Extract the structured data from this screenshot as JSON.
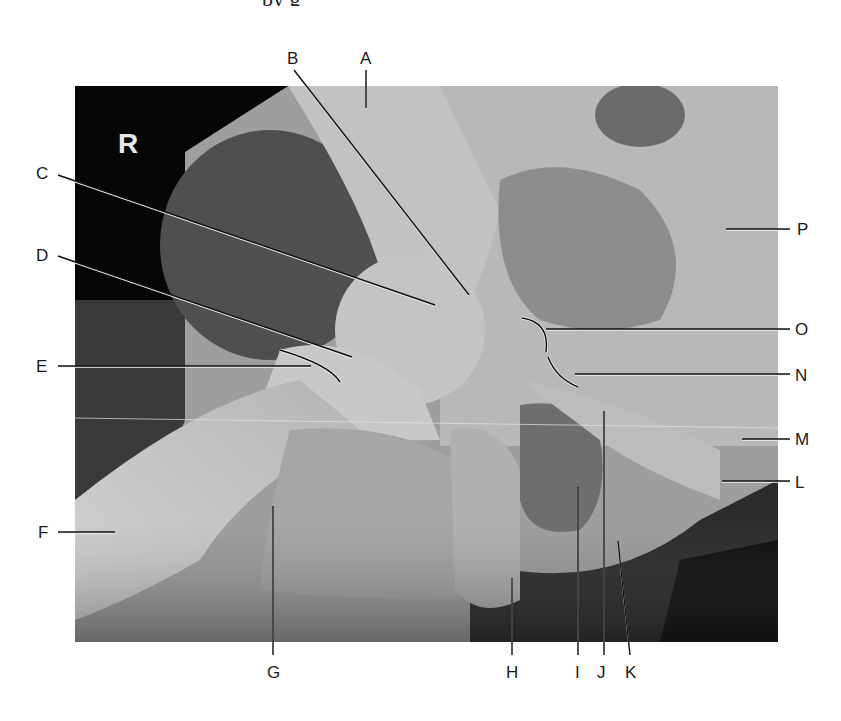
{
  "figure": {
    "caption_fragment": "by  g",
    "side_marker": "R",
    "image_region": {
      "x": 75,
      "y": 86,
      "width": 703,
      "height": 556
    },
    "colors": {
      "background": "#ffffff",
      "label_text": "#1a1a1a",
      "leader_line": "#111111",
      "leader_halo": "#f2f2f2",
      "film_dark": "#050505",
      "bone_light": "#c9c9c9",
      "soft_tissue": "#8e8e8e"
    }
  },
  "labels": [
    {
      "id": "A",
      "text": "A",
      "x": 360,
      "y": 50,
      "line": [
        [
          366,
          70
        ],
        [
          366,
          108
        ]
      ]
    },
    {
      "id": "B",
      "text": "B",
      "x": 287,
      "y": 50,
      "line": [
        [
          294,
          70
        ],
        [
          469,
          295
        ]
      ]
    },
    {
      "id": "C",
      "text": "C",
      "x": 36,
      "y": 165,
      "line": [
        [
          58,
          175
        ],
        [
          435,
          305
        ]
      ]
    },
    {
      "id": "D",
      "text": "D",
      "x": 36,
      "y": 247,
      "line": [
        [
          58,
          256
        ],
        [
          352,
          357
        ]
      ]
    },
    {
      "id": "E",
      "text": "E",
      "x": 36,
      "y": 358,
      "line": [
        [
          58,
          366
        ],
        [
          311,
          366
        ]
      ]
    },
    {
      "id": "F",
      "text": "F",
      "x": 38,
      "y": 524,
      "line": [
        [
          58,
          532
        ],
        [
          115,
          532
        ]
      ]
    },
    {
      "id": "G",
      "text": "G",
      "x": 267,
      "y": 664,
      "line": [
        [
          273,
          506
        ],
        [
          273,
          655
        ]
      ]
    },
    {
      "id": "H",
      "text": "H",
      "x": 506,
      "y": 664,
      "line": [
        [
          512,
          578
        ],
        [
          512,
          655
        ]
      ]
    },
    {
      "id": "I",
      "text": "I",
      "x": 575,
      "y": 664,
      "line": [
        [
          578,
          487
        ],
        [
          578,
          655
        ]
      ]
    },
    {
      "id": "J",
      "text": "J",
      "x": 597,
      "y": 664,
      "line": [
        [
          604,
          411
        ],
        [
          604,
          655
        ]
      ]
    },
    {
      "id": "K",
      "text": "K",
      "x": 625,
      "y": 664,
      "line": [
        [
          618,
          541
        ],
        [
          630,
          655
        ]
      ]
    },
    {
      "id": "L",
      "text": "L",
      "x": 795,
      "y": 474,
      "line": [
        [
          722,
          481
        ],
        [
          790,
          481
        ]
      ]
    },
    {
      "id": "M",
      "text": "M",
      "x": 795,
      "y": 431,
      "line": [
        [
          742,
          439
        ],
        [
          790,
          439
        ]
      ]
    },
    {
      "id": "N",
      "text": "N",
      "x": 795,
      "y": 367,
      "line": [
        [
          575,
          374
        ],
        [
          790,
          374
        ]
      ]
    },
    {
      "id": "O",
      "text": "O",
      "x": 795,
      "y": 321,
      "line": [
        [
          546,
          329
        ],
        [
          790,
          329
        ]
      ]
    },
    {
      "id": "P",
      "text": "P",
      "x": 797,
      "y": 221,
      "line": [
        [
          726,
          229
        ],
        [
          790,
          229
        ]
      ]
    }
  ],
  "curved_markers": [
    {
      "for": "O",
      "path": "M 522 318 Q 550 322 546 352"
    },
    {
      "for": "N",
      "path": "M 548 357 Q 556 378 578 387"
    },
    {
      "for": "E",
      "path": "M 280 350 Q 330 365 340 382"
    }
  ]
}
